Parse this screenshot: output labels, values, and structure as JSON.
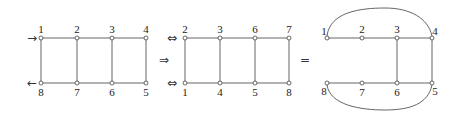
{
  "diagram": {
    "graph1": {
      "top_labels": [
        "1",
        "2",
        "3",
        "4"
      ],
      "bottom_labels": [
        "8",
        "7",
        "6",
        "5"
      ],
      "in_arrow": "→",
      "out_arrow": "←"
    },
    "implies_symbol": "⇒",
    "graph2": {
      "top_labels": [
        "2",
        "3",
        "6",
        "7"
      ],
      "bottom_labels": [
        "1",
        "4",
        "5",
        "8"
      ],
      "top_port": "⇔",
      "bottom_port": "⇔"
    },
    "equals_symbol": "=",
    "graph3": {
      "top_labels": [
        "1",
        "2",
        "3",
        "4"
      ],
      "bottom_labels": [
        "8",
        "7",
        "6",
        "5"
      ]
    }
  }
}
